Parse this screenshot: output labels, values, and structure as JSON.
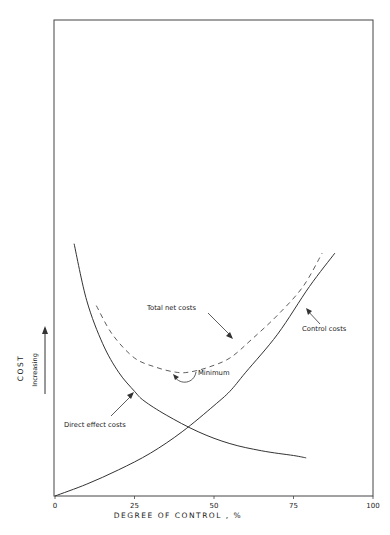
{
  "chart_data": {
    "type": "line",
    "title": "",
    "xlabel": "DEGREE OF CONTROL , %",
    "ylabel": "COST",
    "ylabel_sub": "Increasing",
    "xlim": [
      0,
      100
    ],
    "ylim": [
      0,
      100
    ],
    "x_ticks": [
      0,
      25,
      50,
      75,
      100
    ],
    "x_tick_labels": [
      "0",
      "25",
      "50",
      "75",
      "100"
    ],
    "grid": false,
    "series": [
      {
        "name": "Direct effect costs",
        "style": "solid",
        "x": [
          6,
          10,
          15,
          20,
          25,
          28,
          35,
          45,
          55,
          65,
          75,
          79
        ],
        "y": [
          53,
          41,
          32,
          26,
          22,
          20,
          17,
          13.5,
          11,
          9.5,
          8.5,
          8
        ]
      },
      {
        "name": "Control costs",
        "style": "solid",
        "x": [
          0,
          10,
          20,
          30,
          40,
          50,
          55,
          60,
          70,
          80,
          88
        ],
        "y": [
          0,
          2.5,
          5.5,
          9,
          13.5,
          19,
          22,
          26,
          34,
          44,
          51
        ]
      },
      {
        "name": "Total net costs",
        "style": "dashed",
        "x": [
          13,
          18,
          25,
          32,
          38,
          42,
          48,
          55,
          62,
          70,
          78,
          84
        ],
        "y": [
          40,
          34,
          29,
          27,
          26,
          26,
          27,
          29,
          33,
          38,
          44,
          51
        ]
      }
    ],
    "annotations": [
      {
        "text": "Total net costs",
        "points_to": "Total net costs"
      },
      {
        "text": "Control costs",
        "points_to": "Control costs"
      },
      {
        "text": "Direct effect costs",
        "points_to": "Direct effect costs"
      },
      {
        "text": "Minimum",
        "points_to": "Total net costs minimum"
      }
    ]
  }
}
